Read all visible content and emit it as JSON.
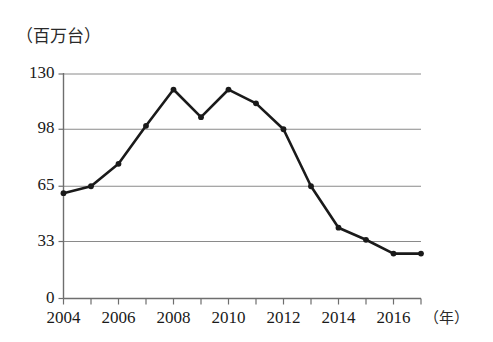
{
  "chart_data": {
    "type": "line",
    "title": "",
    "subtitle": "",
    "xlabel": "（年）",
    "ylabel": "（百万台）",
    "x": [
      2004,
      2005,
      2006,
      2007,
      2008,
      2009,
      2010,
      2011,
      2012,
      2013,
      2014,
      2015,
      2016,
      2017
    ],
    "values": [
      61,
      65,
      78,
      100,
      121,
      105,
      121,
      113,
      98,
      65,
      41,
      34,
      26,
      26
    ],
    "series": [
      {
        "name": "",
        "values": [
          61,
          65,
          78,
          100,
          121,
          105,
          121,
          113,
          98,
          65,
          41,
          34,
          26,
          26
        ]
      }
    ],
    "categories": [
      "2004",
      "2005",
      "2006",
      "2007",
      "2008",
      "2009",
      "2010",
      "2011",
      "2012",
      "2013",
      "2014",
      "2015",
      "2016",
      "2017"
    ],
    "xlim": [
      2004,
      2017
    ],
    "ylim": [
      0,
      130
    ],
    "ytick_labels": [
      "0",
      "33",
      "65",
      "98",
      "130"
    ],
    "ytick_values": [
      0,
      33,
      65,
      98,
      130
    ],
    "xtick_labels": [
      "2004",
      "2006",
      "2008",
      "2010",
      "2012",
      "2014",
      "2016"
    ],
    "xtick_values": [
      2004,
      2006,
      2008,
      2010,
      2012,
      2014,
      2016
    ],
    "grid": true,
    "grid_axis": "y",
    "legend": false,
    "legend_position": "none",
    "marker": "filled-circle",
    "line_color": "#1a1a1a",
    "grid_color": "#8a8a8a",
    "axis_color": "#6e6e6e",
    "background_color": "#ffffff"
  },
  "axis": {
    "y_unit": "（百万台）",
    "x_unit": "（年）"
  }
}
